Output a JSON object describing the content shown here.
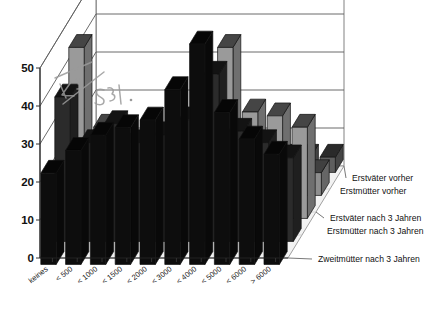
{
  "chart_data": {
    "type": "bar",
    "title": "",
    "subtitle": "",
    "xlabel": "",
    "ylabel": "",
    "ylim": [
      0,
      50
    ],
    "yticks": [
      0,
      10,
      20,
      30,
      40,
      50
    ],
    "grid": true,
    "legend_position": "right",
    "projection": "3d-depth-rows",
    "categories": [
      "keines",
      "< 500",
      "< 1000",
      "< 1500",
      "< 2000",
      "< 3000",
      "< 4000",
      "< 5000",
      "< 6000",
      "> 6000"
    ],
    "series": [
      {
        "name": "Erstväter vorher",
        "color": "#0d0d0d",
        "row": 0,
        "values": [
          24,
          30,
          34,
          36,
          38,
          46,
          58,
          40,
          33,
          29
        ]
      },
      {
        "name": "Erstmütter vorher",
        "color": "#2b2b2b",
        "row": 1,
        "values": [
          38,
          26,
          31,
          26,
          28,
          32,
          44,
          29,
          26,
          22
        ]
      },
      {
        "name": "Erstväter nach 3 Jahren",
        "color": "#9a9a9a",
        "row": 2,
        "values": [
          45,
          24,
          19,
          22,
          20,
          21,
          45,
          28,
          27,
          24
        ]
      },
      {
        "name": "Erstmütter nach 3 Jahren",
        "color": "#8e8e8e",
        "row": 3,
        "values": [
          10,
          8,
          5,
          9,
          13,
          17,
          12,
          8,
          7,
          6
        ]
      },
      {
        "name": "Zweitmütter nach 3 Jahren",
        "color": "#5e5e5e",
        "row": 4,
        "values": [
          4,
          4,
          4,
          5,
          4,
          4,
          4,
          4,
          4,
          4
        ]
      }
    ],
    "annotations": [
      {
        "text": "46",
        "kind": "handwritten"
      },
      {
        "text": "35",
        "kind": "handwritten"
      }
    ]
  },
  "legend": {
    "items": [
      {
        "label": "Erstväter vorher"
      },
      {
        "label": "Erstmütter vorher"
      },
      {
        "label": "Erstväter nach 3 Jahren"
      },
      {
        "label": "Erstmütter nach 3 Jahren"
      },
      {
        "label": "Zweitmütter nach 3 Jahren"
      }
    ]
  },
  "axis": {
    "y_ticks": [
      "0",
      "10",
      "20",
      "30",
      "40",
      "50"
    ],
    "x_ticks": [
      "keines",
      "< 500",
      "< 1000",
      "< 1500",
      "< 2000",
      "< 3000",
      "< 4000",
      "< 5000",
      "< 6000",
      "> 6000"
    ]
  },
  "colors": {
    "front_face": "#9b9b9b",
    "top_face": "#3a3a3a",
    "side_face": "#6d6d6d",
    "dark_bar": "#101010",
    "mid_bar": "#5e5e5e",
    "floor": "#f2f2f2",
    "grid": "#5a5a5a"
  }
}
